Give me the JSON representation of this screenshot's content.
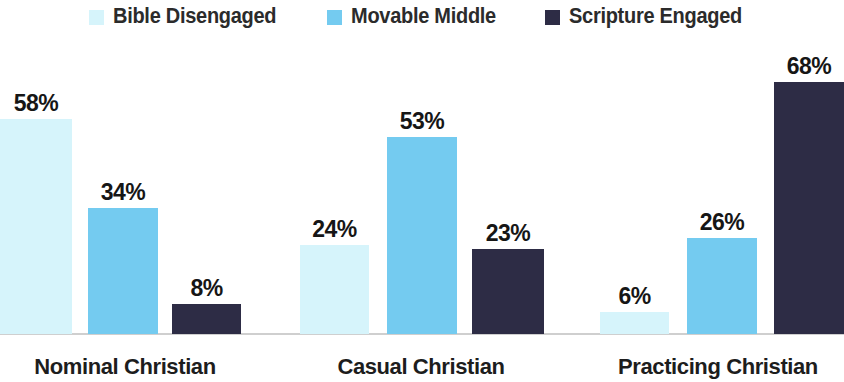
{
  "chart_data": {
    "type": "bar",
    "title": "",
    "subtitle": "",
    "xlabel": "",
    "ylabel": "",
    "ylim": [
      0,
      68
    ],
    "grid": false,
    "legend_position": "top-center",
    "categories": [
      "Nominal Christian",
      "Casual Christian",
      "Practicing Christian"
    ],
    "series": [
      {
        "name": "Bible Disengaged",
        "color": "#d6f4fb",
        "values": [
          58,
          24,
          6
        ],
        "labels": [
          "58%",
          "24%",
          "6%"
        ]
      },
      {
        "name": "Movable Middle",
        "color": "#74cbf0",
        "values": [
          34,
          53,
          26
        ],
        "labels": [
          "34%",
          "53%",
          "26%"
        ]
      },
      {
        "name": "Scripture Engaged",
        "color": "#2d2c45",
        "values": [
          8,
          23,
          68
        ],
        "labels": [
          "8%",
          "23%",
          "68%"
        ]
      }
    ]
  },
  "legend": {
    "items": [
      {
        "label": "Bible Disengaged",
        "color": "#d6f4fb",
        "icon": "square-swatch-icon"
      },
      {
        "label": "Movable Middle",
        "color": "#74cbf0",
        "icon": "square-swatch-icon"
      },
      {
        "label": "Scripture Engaged",
        "color": "#2d2c45",
        "icon": "square-swatch-icon"
      }
    ]
  },
  "axis": {
    "category_labels": [
      "Nominal Christian",
      "Casual Christian",
      "Practicing Christian"
    ]
  },
  "bars": [
    {
      "group": 0,
      "series": 0,
      "label": "58%",
      "value": 58,
      "color": "#d6f4fb",
      "x": 0,
      "w": 72
    },
    {
      "group": 0,
      "series": 1,
      "label": "34%",
      "value": 34,
      "color": "#74cbf0",
      "x": 88,
      "w": 70
    },
    {
      "group": 0,
      "series": 2,
      "label": "8%",
      "value": 8,
      "color": "#2d2c45",
      "x": 172,
      "w": 69
    },
    {
      "group": 1,
      "series": 0,
      "label": "24%",
      "value": 24,
      "color": "#d6f4fb",
      "x": 300,
      "w": 69
    },
    {
      "group": 1,
      "series": 1,
      "label": "53%",
      "value": 53,
      "color": "#74cbf0",
      "x": 387,
      "w": 70
    },
    {
      "group": 1,
      "series": 2,
      "label": "23%",
      "value": 23,
      "color": "#2d2c45",
      "x": 472,
      "w": 72
    },
    {
      "group": 2,
      "series": 0,
      "label": "6%",
      "value": 6,
      "color": "#d6f4fb",
      "x": 600,
      "w": 69
    },
    {
      "group": 2,
      "series": 1,
      "label": "26%",
      "value": 26,
      "color": "#74cbf0",
      "x": 687,
      "w": 70
    },
    {
      "group": 2,
      "series": 2,
      "label": "68%",
      "value": 68,
      "color": "#2d2c45",
      "x": 774,
      "w": 70
    }
  ],
  "group_label_positions": [
    {
      "left": 0,
      "width": 250
    },
    {
      "left": 296,
      "width": 250
    },
    {
      "left": 592,
      "width": 252
    }
  ],
  "scale": {
    "px_per_percent": 3.71,
    "baseline_offset": 48
  }
}
